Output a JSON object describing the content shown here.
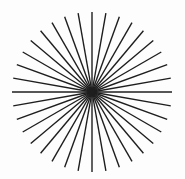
{
  "figure": {
    "type": "radial-line-pattern",
    "line_count": 36,
    "angle_step_deg": 10,
    "center": [
      92,
      92
    ],
    "radius": 80,
    "line_color": "#1e1e1e",
    "background_color": "#fdfdfd",
    "stroke_width": 1.4
  }
}
